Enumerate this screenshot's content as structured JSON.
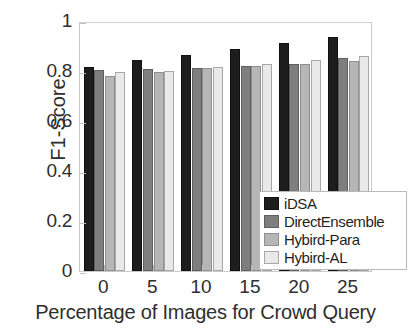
{
  "chart_data": {
    "type": "bar",
    "title": "",
    "xlabel": "Percentage of Images for Crowd Query",
    "ylabel": "F1-Score",
    "categories": [
      "0",
      "5",
      "10",
      "15",
      "20",
      "25"
    ],
    "xlim": [
      -0.5,
      5.5
    ],
    "ylim": [
      0,
      1
    ],
    "yticks": [
      "0",
      "0.2",
      "0.4",
      "0.6",
      "0.8",
      "1"
    ],
    "ytick_values": [
      0,
      0.2,
      0.4,
      0.6,
      0.8,
      1
    ],
    "xticks": [
      "0",
      "5",
      "10",
      "15",
      "20",
      "25"
    ],
    "grid": false,
    "legend_position": "lower right",
    "series": [
      {
        "name": "iDSA",
        "color": "#1d1d1d",
        "values": [
          0.816,
          0.845,
          0.866,
          0.887,
          0.913,
          0.936
        ]
      },
      {
        "name": "DirectEnsemble",
        "color": "#7e7e7e",
        "values": [
          0.804,
          0.81,
          0.812,
          0.821,
          0.829,
          0.851
        ]
      },
      {
        "name": "Hybird-Para",
        "color": "#b6b6b6",
        "values": [
          0.779,
          0.795,
          0.811,
          0.819,
          0.827,
          0.839
        ]
      },
      {
        "name": "Hybird-AL",
        "color": "#e9e9e9",
        "values": [
          0.795,
          0.8,
          0.816,
          0.827,
          0.844,
          0.861
        ]
      }
    ]
  },
  "legend": {
    "items": [
      {
        "label": "iDSA",
        "color": "#1d1d1d"
      },
      {
        "label": "DirectEnsemble",
        "color": "#7e7e7e"
      },
      {
        "label": "Hybird-Para",
        "color": "#b6b6b6"
      },
      {
        "label": "Hybird-AL",
        "color": "#e9e9e9"
      }
    ]
  },
  "axes": {
    "y_title": "F1-Score",
    "x_title": "Percentage of Images for Crowd Query",
    "y_tick_labels": [
      "0",
      "0.2",
      "0.4",
      "0.6",
      "0.8",
      "1"
    ],
    "x_tick_labels": [
      "0",
      "5",
      "10",
      "15",
      "20",
      "25"
    ]
  }
}
